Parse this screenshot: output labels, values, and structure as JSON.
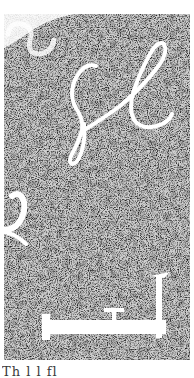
{
  "image": {
    "description": "Speckled black-and-white noise texture with white calligraphic strokes",
    "background_color": "#ffffff",
    "noise_dark": "#2a2a2a",
    "noise_light": "#e8e8e8",
    "stroke_color": "#ffffff",
    "shapes": [
      {
        "name": "top-left-swirl",
        "kind": "curl"
      },
      {
        "name": "script-sl",
        "kind": "cursive letters"
      },
      {
        "name": "left-edge-hook",
        "kind": "hook"
      },
      {
        "name": "bottom-bracket",
        "kind": "L-shaped bracket with T mark"
      }
    ]
  },
  "caption": {
    "text": "Th                    l         l      fl",
    "note": "cropped text at bottom edge"
  }
}
